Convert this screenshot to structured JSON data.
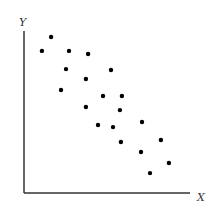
{
  "chart_data": {
    "type": "scatter",
    "title": "",
    "xlabel": "X",
    "ylabel": "Y",
    "xlim": [
      0,
      100
    ],
    "ylim": [
      0,
      100
    ],
    "grid": false,
    "legend": null,
    "tick_labels": false,
    "series": [
      {
        "name": "points",
        "color": "#000000",
        "points": [
          {
            "x": 16.3,
            "y": 96.3
          },
          {
            "x": 10.8,
            "y": 87.7
          },
          {
            "x": 27.1,
            "y": 87.7
          },
          {
            "x": 38.6,
            "y": 85.8
          },
          {
            "x": 25.3,
            "y": 76.5
          },
          {
            "x": 52.4,
            "y": 75.9
          },
          {
            "x": 37.3,
            "y": 70.4
          },
          {
            "x": 22.3,
            "y": 63.6
          },
          {
            "x": 47.6,
            "y": 59.9
          },
          {
            "x": 59.0,
            "y": 59.9
          },
          {
            "x": 37.3,
            "y": 53.1
          },
          {
            "x": 57.8,
            "y": 51.2
          },
          {
            "x": 44.6,
            "y": 42.0
          },
          {
            "x": 53.6,
            "y": 40.7
          },
          {
            "x": 71.1,
            "y": 43.8
          },
          {
            "x": 58.4,
            "y": 31.5
          },
          {
            "x": 82.5,
            "y": 32.7
          },
          {
            "x": 70.5,
            "y": 25.3
          },
          {
            "x": 87.3,
            "y": 18.5
          },
          {
            "x": 75.9,
            "y": 12.3
          }
        ]
      }
    ],
    "annotations": []
  },
  "colors": {
    "axis": "#333333",
    "point": "#000000",
    "background": "#ffffff"
  }
}
